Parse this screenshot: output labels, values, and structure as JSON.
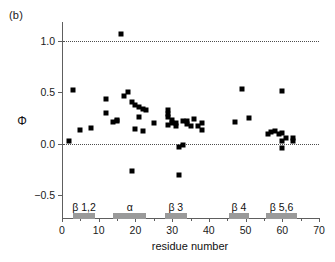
{
  "panel": {
    "label": "(b)"
  },
  "chart_data": {
    "type": "scatter",
    "title": "",
    "xlabel": "residue number",
    "ylabel": "Φ",
    "xlim": [
      0,
      70
    ],
    "ylim": [
      -0.72,
      1.18
    ],
    "xticks": [
      0,
      10,
      20,
      30,
      40,
      50,
      60,
      70
    ],
    "xtick_labels": [
      "0",
      "10",
      "20",
      "30",
      "40",
      "50",
      "60",
      "70"
    ],
    "xticks_minor": [
      5,
      15,
      25,
      35,
      45,
      55,
      65
    ],
    "yticks": [
      -0.5,
      0.0,
      0.5,
      1.0
    ],
    "ytick_labels": [
      "−0.5",
      "0.0",
      "0.5",
      "1.0"
    ],
    "grid": false,
    "reference_lines": [
      0.0,
      1.0
    ],
    "legend": "none",
    "marker": "square",
    "marker_color": "#000000",
    "series": [
      {
        "name": "Φ value",
        "x": [
          2,
          3,
          5,
          8,
          12,
          12,
          14,
          15,
          15,
          16,
          17,
          18,
          19,
          19,
          20,
          20,
          21,
          21,
          22,
          22,
          23,
          25,
          29,
          29,
          29,
          29,
          30,
          30,
          31,
          31,
          32,
          32,
          33,
          33,
          34,
          34,
          35,
          36,
          37,
          38,
          38,
          47,
          49,
          51,
          56,
          57,
          58,
          59,
          60,
          60,
          60,
          60,
          61,
          63,
          63
        ],
        "y": [
          0.03,
          0.52,
          0.13,
          0.15,
          0.43,
          0.3,
          0.21,
          0.22,
          0.23,
          1.06,
          0.46,
          0.5,
          0.4,
          -0.26,
          0.38,
          0.14,
          0.36,
          0.26,
          0.34,
          0.12,
          0.33,
          0.2,
          0.33,
          0.29,
          0.26,
          0.18,
          0.23,
          0.2,
          0.17,
          0.2,
          -0.03,
          -0.3,
          0.22,
          -0.01,
          0.19,
          0.22,
          0.17,
          0.24,
          0.17,
          0.2,
          0.13,
          0.21,
          0.53,
          0.25,
          0.09,
          0.11,
          0.12,
          0.09,
          0.51,
          0.1,
          0.03,
          -0.04,
          0.06,
          0.06,
          0.03
        ]
      }
    ],
    "annotations": [
      {
        "label": "β 1,2",
        "start": 3.0,
        "end": 9.0,
        "center": 6.0
      },
      {
        "label": "α",
        "start": 14.0,
        "end": 23.0,
        "center": 18.5
      },
      {
        "label": "β 3",
        "start": 28.0,
        "end": 34.0,
        "center": 31.0
      },
      {
        "label": "β 4",
        "start": 45.5,
        "end": 51.0,
        "center": 48.2
      },
      {
        "label": "β 5,6",
        "start": 55.5,
        "end": 64.0,
        "center": 59.8
      }
    ],
    "annotation_bar_value": -0.675,
    "annotation_label_value": -0.555
  }
}
